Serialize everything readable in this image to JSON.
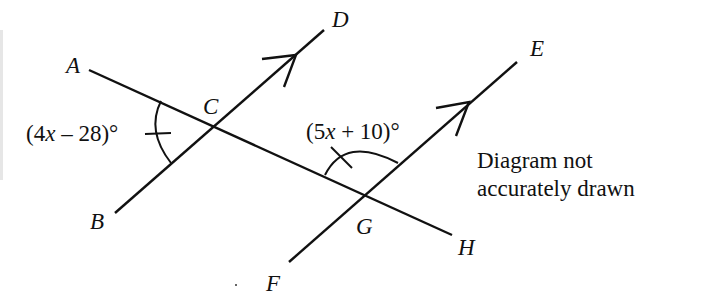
{
  "diagram": {
    "points": {
      "A": {
        "label": "A",
        "x": 89,
        "y": 70
      },
      "B": {
        "label": "B",
        "x": 115,
        "y": 213
      },
      "C": {
        "label": "C",
        "x": 216,
        "y": 125
      },
      "D": {
        "label": "D",
        "x": 324,
        "y": 30
      },
      "E": {
        "label": "E",
        "x": 517,
        "y": 62
      },
      "F": {
        "label": "F",
        "x": 289,
        "y": 262
      },
      "G": {
        "label": "G",
        "x": 364,
        "y": 195
      },
      "H": {
        "label": "H",
        "x": 452,
        "y": 235
      }
    },
    "segments": [
      {
        "from": "A",
        "to": "H",
        "name": "transversal"
      },
      {
        "from": "B",
        "to": "D",
        "name": "parallel-line-1",
        "arrow": true
      },
      {
        "from": "F",
        "to": "E",
        "name": "parallel-line-2",
        "arrow": true
      }
    ],
    "angles": {
      "at_C": {
        "expression_prefix": "(4",
        "variable": "x",
        "expression_suffix": " – 28)°",
        "vertex": "C",
        "between": [
          "A",
          "B"
        ]
      },
      "at_G": {
        "expression_prefix": "(5",
        "variable": "x",
        "expression_suffix": " + 10)°",
        "vertex": "G",
        "between": [
          "A",
          "E"
        ]
      }
    },
    "note": {
      "line1": "Diagram not",
      "line2": "accurately drawn"
    },
    "colors": {
      "ink": "#111111",
      "background": "#ffffff"
    }
  }
}
